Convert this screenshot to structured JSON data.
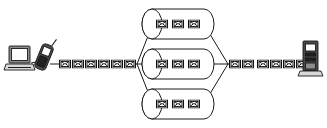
{
  "diagram": {
    "type": "network-flow",
    "width": 327,
    "height": 128,
    "background_color": "#ffffff",
    "line_color": "#1a1a1a"
  },
  "nodes": {
    "source": {
      "laptop": {
        "icon": "laptop-icon",
        "label": "Laptop",
        "x": 8,
        "y": 46,
        "width": 26,
        "height": 22
      },
      "phone": {
        "icon": "mobile-phone-icon",
        "label": "Mobile phone",
        "x": 36,
        "y": 42,
        "width": 16,
        "height": 30
      }
    },
    "destination": {
      "server": {
        "icon": "server-tower-icon",
        "label": "Server tower",
        "x": 300,
        "y": 40,
        "width": 18,
        "height": 34
      }
    },
    "split_junction": {
      "label": "Fan-out junction",
      "x": 136,
      "y": 64
    },
    "merge_junction": {
      "label": "Fan-in junction",
      "x": 228,
      "y": 64
    }
  },
  "queues": [
    {
      "name": "queue-top",
      "label": "Top queue",
      "cx": 178,
      "cy": 24,
      "width": 66,
      "height": 30,
      "message_count": 3,
      "messages": [
        "message-icon",
        "message-icon",
        "message-icon"
      ]
    },
    {
      "name": "queue-middle",
      "label": "Middle queue",
      "cx": 178,
      "cy": 64,
      "width": 66,
      "height": 30,
      "message_count": 3,
      "messages": [
        "message-icon",
        "message-icon",
        "message-icon"
      ]
    },
    {
      "name": "queue-bottom",
      "label": "Bottom queue",
      "cx": 178,
      "cy": 104,
      "width": 66,
      "height": 30,
      "message_count": 3,
      "messages": [
        "message-icon",
        "message-icon",
        "message-icon"
      ]
    }
  ],
  "message_chains": [
    {
      "name": "inbound-chain",
      "label": "Inbound message chain",
      "count": 6,
      "start_x": 59,
      "y": 64,
      "spacing": 13,
      "envelope_width": 12,
      "envelope_height": 9,
      "messages": [
        "message-icon",
        "message-icon",
        "message-icon",
        "message-icon",
        "message-icon",
        "message-icon"
      ]
    },
    {
      "name": "outbound-chain",
      "label": "Outbound message chain",
      "count": 6,
      "start_x": 233,
      "y": 64,
      "spacing": 13,
      "envelope_width": 12,
      "envelope_height": 9,
      "messages": [
        "message-icon",
        "message-icon",
        "message-icon",
        "message-icon",
        "message-icon",
        "message-icon"
      ]
    }
  ],
  "connections": [
    {
      "name": "laptop-to-phone",
      "from": "laptop",
      "to": "phone"
    },
    {
      "name": "phone-to-inbound",
      "from": "phone",
      "to": "inbound-chain"
    },
    {
      "name": "split-to-queue-top",
      "from": "split_junction",
      "to": "queue-top"
    },
    {
      "name": "split-to-queue-middle",
      "from": "split_junction",
      "to": "queue-middle"
    },
    {
      "name": "split-to-queue-bottom",
      "from": "split_junction",
      "to": "queue-bottom"
    },
    {
      "name": "queue-top-to-merge",
      "from": "queue-top",
      "to": "merge_junction"
    },
    {
      "name": "queue-middle-to-merge",
      "from": "queue-middle",
      "to": "merge_junction"
    },
    {
      "name": "queue-bottom-to-merge",
      "from": "queue-bottom",
      "to": "merge_junction"
    },
    {
      "name": "outbound-to-server",
      "from": "outbound-chain",
      "to": "server"
    }
  ]
}
